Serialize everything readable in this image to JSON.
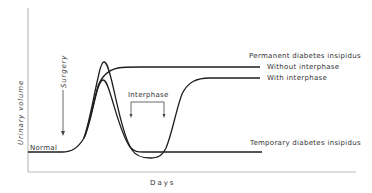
{
  "figure": {
    "axes": {
      "ylabel": "Urinary volume",
      "xlabel": "Days"
    },
    "annotations": {
      "normal": "Normal",
      "surgery": "Surgery",
      "interphase": "Interphase",
      "permanent": "Permanent diabetes insipidus",
      "without_interphase": "Without interphase",
      "with_interphase": "With interphase",
      "temporary": "Temporary diabetes insipidus"
    },
    "curves": [
      {
        "name": "Permanent diabetes insipidus - without interphase",
        "shape": "rise to plateau"
      },
      {
        "name": "Permanent diabetes insipidus - with interphase",
        "shape": "rise, dip below normal, rise to plateau"
      },
      {
        "name": "Temporary diabetes insipidus",
        "shape": "rise then return to normal"
      }
    ]
  }
}
